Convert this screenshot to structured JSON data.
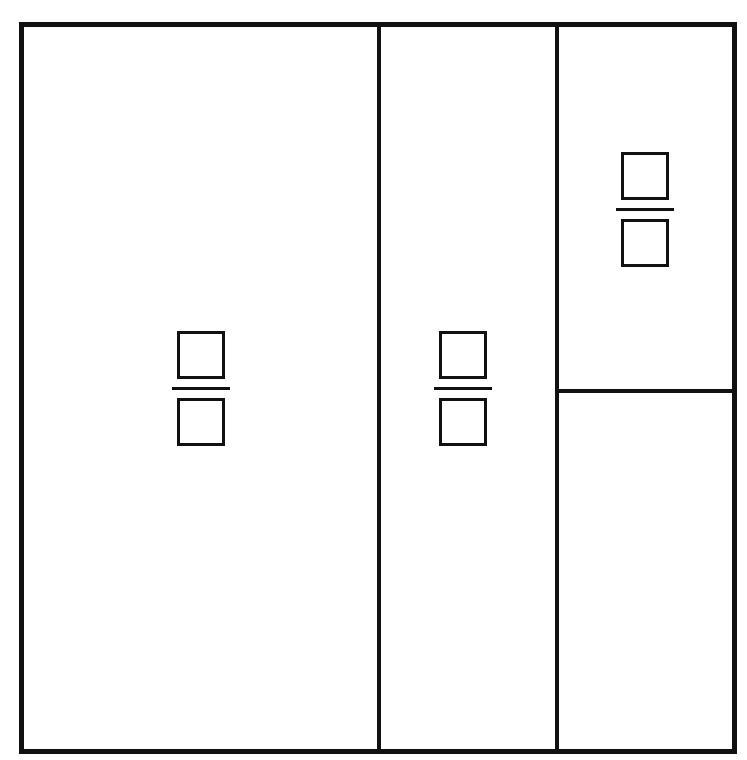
{
  "diagram": {
    "type": "area-model-partition",
    "stroke_color": "#111111",
    "fill_color": "#ffffff",
    "regions": [
      {
        "id": "left",
        "label": "",
        "has_fraction_blank": true,
        "numerator": "",
        "denominator": ""
      },
      {
        "id": "middle",
        "label": "",
        "has_fraction_blank": true,
        "numerator": "",
        "denominator": ""
      },
      {
        "id": "top-right",
        "label": "",
        "has_fraction_blank": true,
        "numerator": "",
        "denominator": ""
      },
      {
        "id": "bottom-right",
        "label": "",
        "has_fraction_blank": false
      }
    ]
  }
}
